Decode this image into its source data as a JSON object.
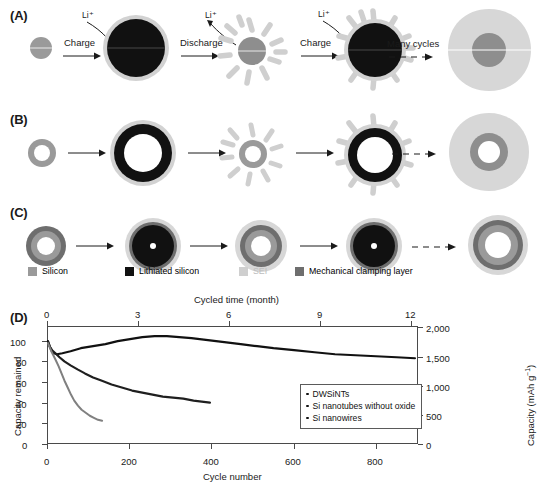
{
  "figure": {
    "panels": [
      {
        "id": "A",
        "label": "(A)"
      },
      {
        "id": "B",
        "label": "(B)"
      },
      {
        "id": "C",
        "label": "(C)"
      },
      {
        "id": "D",
        "label": "(D)"
      }
    ]
  },
  "panel_a": {
    "label": "(A)",
    "steps": [
      {
        "name": "charge-1",
        "text": "Charge"
      },
      {
        "name": "discharge-1",
        "text": "Discharge"
      },
      {
        "name": "charge-2",
        "text": "Charge"
      },
      {
        "name": "many-cycles",
        "text": "Many cycles"
      }
    ],
    "ion_labels": [
      "Li⁺",
      "Li⁺",
      "Li⁺"
    ]
  },
  "panel_b": {
    "label": "(B)"
  },
  "panel_c": {
    "label": "(C)"
  },
  "materials_legend": [
    {
      "name": "silicon",
      "label": "Silicon",
      "color": "#9a9a9a"
    },
    {
      "name": "lithiated-silicon",
      "label": "Lithiated silicon",
      "color": "#111111"
    },
    {
      "name": "sei",
      "label": "SEI",
      "color": "#cfcfcf"
    },
    {
      "name": "mechanical-clamping",
      "label": "Mechanical clamping layer",
      "color": "#6e6e6e"
    }
  ],
  "chart_data": {
    "type": "line",
    "title": "",
    "xlabel": "Cycle number",
    "ylabel": "Capacity remained",
    "xlabel_top": "Cycled time (month)",
    "ylabel_right": "Capacity (mAh g⁻¹)",
    "xlim": [
      0,
      900
    ],
    "ylim": [
      0,
      115
    ],
    "ylim_right": [
      0,
      2000
    ],
    "xticks": [
      0,
      200,
      400,
      600,
      800
    ],
    "xticklabels": [
      "0",
      "200",
      "400",
      "600",
      "800"
    ],
    "xticks_top": [
      0,
      3,
      6,
      9,
      12
    ],
    "xticklabels_top": [
      "0",
      "3",
      "6",
      "9",
      "12"
    ],
    "yticks": [
      0,
      20,
      40,
      60,
      80,
      100
    ],
    "yticklabels": [
      "0",
      "20",
      "40",
      "60",
      "80",
      "100"
    ],
    "yticks_right": [
      0,
      500,
      1000,
      1500,
      2000
    ],
    "yticklabels_right": [
      "0",
      "500",
      "1,000",
      "1,500",
      "2,000"
    ],
    "grid": false,
    "legend_position": "center-right",
    "annotation_arrow": "points to right axis",
    "series": [
      {
        "name": "DWSiNTs",
        "color": "#111111",
        "points": [
          [
            0,
            101
          ],
          [
            4,
            96
          ],
          [
            8,
            92
          ],
          [
            14,
            89
          ],
          [
            22,
            88
          ],
          [
            35,
            89
          ],
          [
            55,
            91
          ],
          [
            80,
            94
          ],
          [
            110,
            96
          ],
          [
            140,
            98
          ],
          [
            170,
            101
          ],
          [
            200,
            103
          ],
          [
            230,
            105
          ],
          [
            260,
            106
          ],
          [
            290,
            106
          ],
          [
            320,
            105
          ],
          [
            350,
            104
          ],
          [
            390,
            102
          ],
          [
            430,
            100
          ],
          [
            470,
            98
          ],
          [
            510,
            96
          ],
          [
            550,
            94
          ],
          [
            600,
            92
          ],
          [
            650,
            90
          ],
          [
            700,
            88
          ],
          [
            750,
            87
          ],
          [
            800,
            86
          ],
          [
            850,
            85
          ],
          [
            895,
            84
          ]
        ]
      },
      {
        "name": "Si nanotubes without oxide",
        "color": "#1f1f1f",
        "points": [
          [
            0,
            100
          ],
          [
            5,
            95
          ],
          [
            10,
            92
          ],
          [
            18,
            89
          ],
          [
            28,
            85
          ],
          [
            40,
            81
          ],
          [
            55,
            77
          ],
          [
            72,
            73
          ],
          [
            90,
            69
          ],
          [
            110,
            65
          ],
          [
            130,
            62
          ],
          [
            155,
            58
          ],
          [
            180,
            55
          ],
          [
            205,
            52
          ],
          [
            230,
            50
          ],
          [
            255,
            48
          ],
          [
            280,
            46
          ],
          [
            305,
            45
          ],
          [
            330,
            44
          ],
          [
            355,
            42
          ],
          [
            375,
            41
          ],
          [
            395,
            40
          ]
        ]
      },
      {
        "name": "Si nanowires",
        "color": "#808080",
        "points": [
          [
            0,
            99
          ],
          [
            4,
            95
          ],
          [
            8,
            91
          ],
          [
            13,
            87
          ],
          [
            19,
            82
          ],
          [
            26,
            76
          ],
          [
            33,
            69
          ],
          [
            40,
            62
          ],
          [
            48,
            55
          ],
          [
            56,
            48
          ],
          [
            64,
            42
          ],
          [
            73,
            37
          ],
          [
            82,
            33
          ],
          [
            92,
            30
          ],
          [
            102,
            27
          ],
          [
            112,
            25
          ],
          [
            122,
            23
          ],
          [
            132,
            22
          ]
        ]
      }
    ]
  }
}
